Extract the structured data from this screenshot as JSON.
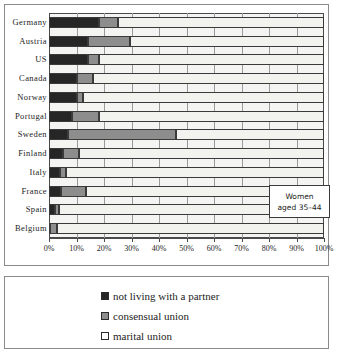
{
  "chart_data": {
    "type": "bar",
    "subtype": "horizontal-stacked-100",
    "title": "",
    "xlabel": "",
    "ylabel": "",
    "xlim": [
      0,
      100
    ],
    "grid": true,
    "legend_position": "bottom",
    "categories": [
      "Germany",
      "Austria",
      "US",
      "Canada",
      "Norway",
      "Portugal",
      "Sweden",
      "Finland",
      "Italy",
      "France",
      "Spain",
      "Belgium"
    ],
    "series": [
      {
        "name": "not living with a partner",
        "color": "#262626",
        "values": [
          18,
          14,
          14,
          10,
          10,
          8.5,
          7,
          5,
          4,
          4.5,
          2,
          0.5
        ]
      },
      {
        "name": "consensual union",
        "color": "#8d8d8d",
        "values": [
          7,
          15.5,
          4,
          6,
          2.5,
          9.5,
          39,
          6,
          2,
          9,
          1.5,
          2.5
        ]
      },
      {
        "name": "marital union",
        "color": "#f2f2ef",
        "values": [
          75,
          70.5,
          82,
          84,
          87.5,
          82,
          54,
          89,
          94,
          86.5,
          96.5,
          97
        ]
      }
    ],
    "xticks": [
      "0%",
      "10%",
      "20%",
      "30%",
      "40%",
      "50%",
      "60%",
      "70%",
      "80%",
      "90%",
      "100%"
    ],
    "xtick_values": [
      0,
      10,
      20,
      30,
      40,
      50,
      60,
      70,
      80,
      90,
      100
    ],
    "annotations": [
      {
        "name": "women-age-callout",
        "line1": "Women",
        "line2": "aged 35–44"
      }
    ]
  },
  "callout": {
    "line1": "Women",
    "line2": "aged 35–44"
  },
  "legend": {
    "items": [
      {
        "label": "not living with a partner",
        "color": "#262626"
      },
      {
        "label": "consensual union",
        "color": "#8d8d8d"
      },
      {
        "label": "marital union",
        "color": "#ffffff"
      }
    ]
  }
}
